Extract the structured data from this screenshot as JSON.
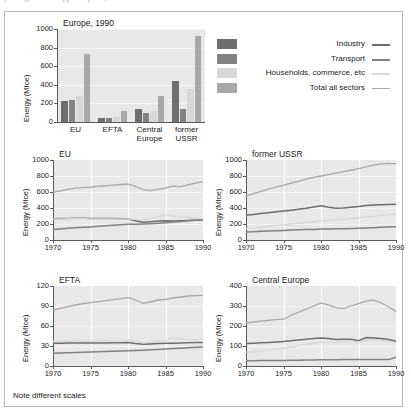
{
  "caption_above": "(not legible — cropped caption)",
  "note": "Note different scales",
  "series_names": {
    "industry": "Industry",
    "transport": "Transport",
    "households": "Households, commerce, etc",
    "total": "Total all sectors"
  },
  "colors": {
    "industry": "#6e6e6e",
    "transport": "#828282",
    "households": "#d8d8d8",
    "total": "#a8a8a8",
    "plot_bg": "#e8e8e8",
    "axis": "#5a5a5a",
    "frame": "#b9b9b9"
  },
  "legend": {
    "rows": [
      {
        "label": "Industry",
        "color": "#6e6e6e"
      },
      {
        "label": "Transport",
        "color": "#828282"
      },
      {
        "label": "Households, commerce, etc",
        "color": "#d8d8d8"
      },
      {
        "label": "Total all sectors",
        "color": "#a8a8a8"
      }
    ]
  },
  "chart_data": [
    {
      "id": "europe-1990-bars",
      "type": "bar",
      "title": "Europe, 1990",
      "xlabel": "",
      "ylabel": "Energy (Mtoe)",
      "ylim": [
        0,
        1000
      ],
      "yticks": [
        0,
        200,
        400,
        600,
        800,
        1000
      ],
      "grid": true,
      "legend_position": "right",
      "categories": [
        "EU",
        "EFTA",
        "Central Europe",
        "former USSR"
      ],
      "series": [
        {
          "name": "Industry",
          "values": [
            225,
            40,
            138,
            440
          ]
        },
        {
          "name": "Transport",
          "values": [
            238,
            38,
            95,
            142
          ]
        },
        {
          "name": "Households, commerce, etc",
          "values": [
            282,
            50,
            118,
            350
          ]
        },
        {
          "name": "Total all sectors",
          "values": [
            730,
            118,
            278,
            930
          ]
        }
      ]
    },
    {
      "id": "eu-lines",
      "type": "line",
      "title": "EU",
      "xlabel": "",
      "ylabel": "Energy (Mtoe)",
      "xlim": [
        1970,
        1990
      ],
      "ylim": [
        0,
        1000
      ],
      "yticks": [
        0,
        200,
        400,
        600,
        800,
        1000
      ],
      "xticks": [
        1970,
        1975,
        1980,
        1985,
        1990
      ],
      "grid": true,
      "x": [
        1970,
        1971,
        1972,
        1973,
        1974,
        1975,
        1976,
        1977,
        1978,
        1979,
        1980,
        1981,
        1982,
        1983,
        1984,
        1985,
        1986,
        1987,
        1988,
        1989,
        1990
      ],
      "series": [
        {
          "name": "Industry",
          "values": [
            265,
            268,
            270,
            272,
            272,
            270,
            270,
            268,
            268,
            266,
            262,
            240,
            222,
            228,
            236,
            240,
            238,
            240,
            244,
            248,
            250
          ]
        },
        {
          "name": "Transport",
          "values": [
            130,
            138,
            146,
            154,
            158,
            164,
            172,
            178,
            184,
            190,
            196,
            198,
            200,
            204,
            210,
            216,
            224,
            232,
            240,
            246,
            252
          ]
        },
        {
          "name": "Households, commerce, etc",
          "values": [
            262,
            264,
            266,
            268,
            266,
            264,
            264,
            264,
            264,
            262,
            260,
            258,
            250,
            268,
            290,
            320,
            300,
            290,
            282,
            272,
            268
          ]
        },
        {
          "name": "Total all sectors",
          "values": [
            600,
            615,
            632,
            648,
            655,
            660,
            670,
            678,
            686,
            694,
            700,
            672,
            630,
            616,
            632,
            650,
            672,
            668,
            690,
            712,
            730
          ]
        }
      ]
    },
    {
      "id": "former-ussr-lines",
      "type": "line",
      "title": "former USSR",
      "xlabel": "",
      "ylabel": "Energy (Mtoe)",
      "xlim": [
        1970,
        1990
      ],
      "ylim": [
        0,
        1000
      ],
      "yticks": [
        0,
        200,
        400,
        600,
        800,
        1000
      ],
      "xticks": [
        1970,
        1975,
        1980,
        1985,
        1990
      ],
      "grid": true,
      "x": [
        1970,
        1971,
        1972,
        1973,
        1974,
        1975,
        1976,
        1977,
        1978,
        1979,
        1980,
        1981,
        1982,
        1983,
        1984,
        1985,
        1986,
        1987,
        1988,
        1989,
        1990
      ],
      "series": [
        {
          "name": "Industry",
          "values": [
            308,
            318,
            330,
            342,
            352,
            362,
            372,
            384,
            396,
            412,
            428,
            410,
            396,
            400,
            408,
            418,
            432,
            436,
            440,
            444,
            448
          ]
        },
        {
          "name": "Transport",
          "values": [
            100,
            104,
            108,
            112,
            116,
            120,
            124,
            128,
            130,
            132,
            136,
            138,
            140,
            142,
            144,
            146,
            150,
            154,
            158,
            162,
            165
          ]
        },
        {
          "name": "Households, commerce, etc",
          "values": [
            142,
            152,
            162,
            172,
            182,
            190,
            200,
            210,
            218,
            228,
            238,
            246,
            254,
            262,
            270,
            278,
            288,
            298,
            308,
            318,
            330
          ]
        },
        {
          "name": "Total all sectors",
          "values": [
            548,
            580,
            608,
            636,
            660,
            684,
            710,
            734,
            760,
            782,
            800,
            818,
            836,
            854,
            872,
            892,
            914,
            936,
            952,
            958,
            952
          ]
        }
      ]
    },
    {
      "id": "efta-lines",
      "type": "line",
      "title": "EFTA",
      "xlabel": "",
      "ylabel": "Energy (Mtoe)",
      "xlim": [
        1970,
        1990
      ],
      "ylim": [
        0,
        120
      ],
      "yticks": [
        0,
        30,
        60,
        90,
        120
      ],
      "xticks": [
        1970,
        1975,
        1980,
        1985,
        1990
      ],
      "grid": true,
      "x": [
        1970,
        1971,
        1972,
        1973,
        1974,
        1975,
        1976,
        1977,
        1978,
        1979,
        1980,
        1981,
        1982,
        1983,
        1984,
        1985,
        1986,
        1987,
        1988,
        1989,
        1990
      ],
      "series": [
        {
          "name": "Industry",
          "values": [
            34.0,
            34.2,
            34.4,
            34.6,
            34.6,
            34.4,
            34.6,
            34.6,
            34.8,
            35.0,
            35.2,
            33.6,
            32.6,
            33.0,
            33.6,
            34.0,
            34.2,
            34.6,
            35.0,
            35.2,
            35.4
          ]
        },
        {
          "name": "Transport",
          "values": [
            19.0,
            19.4,
            19.8,
            20.2,
            20.6,
            21.0,
            21.4,
            21.8,
            22.2,
            22.6,
            23.0,
            23.4,
            23.8,
            24.2,
            24.8,
            25.4,
            26.2,
            26.8,
            27.4,
            28.0,
            28.6
          ]
        },
        {
          "name": "Households, commerce, etc",
          "values": [
            37.0,
            37.2,
            37.4,
            37.6,
            37.6,
            37.4,
            37.6,
            37.8,
            38.0,
            38.2,
            38.6,
            37.6,
            34.6,
            36.0,
            37.8,
            38.6,
            42.4,
            40.6,
            39.8,
            39.6,
            39.8
          ]
        },
        {
          "name": "Total all sectors",
          "values": [
            84.0,
            86.5,
            89.0,
            91.5,
            93.5,
            95.0,
            96.5,
            98.0,
            99.5,
            101.0,
            102.5,
            99.0,
            94.0,
            96.0,
            99.0,
            100.0,
            102.0,
            103.5,
            105.0,
            105.5,
            106.0
          ]
        }
      ]
    },
    {
      "id": "central-europe-lines",
      "type": "line",
      "title": "Central Europe",
      "xlabel": "",
      "ylabel": "Energy (Mtoe)",
      "xlim": [
        1970,
        1990
      ],
      "ylim": [
        0,
        400
      ],
      "yticks": [
        0,
        100,
        200,
        300,
        400
      ],
      "xticks": [
        1970,
        1975,
        1980,
        1985,
        1990
      ],
      "grid": true,
      "x": [
        1970,
        1971,
        1972,
        1973,
        1974,
        1975,
        1976,
        1977,
        1978,
        1979,
        1980,
        1981,
        1982,
        1983,
        1984,
        1985,
        1986,
        1987,
        1988,
        1989,
        1990
      ],
      "series": [
        {
          "name": "Industry",
          "values": [
            112,
            114,
            116,
            118,
            120,
            122,
            126,
            130,
            134,
            138,
            140,
            138,
            132,
            134,
            134,
            126,
            142,
            140,
            138,
            132,
            124
          ]
        },
        {
          "name": "Transport",
          "values": [
            26,
            26,
            27,
            27,
            28,
            28,
            29,
            29,
            30,
            30,
            31,
            31,
            31,
            32,
            32,
            32,
            33,
            33,
            33,
            32,
            44
          ]
        },
        {
          "name": "Households, commerce, etc",
          "values": [
            68,
            72,
            76,
            80,
            84,
            88,
            96,
            102,
            108,
            114,
            120,
            120,
            118,
            122,
            124,
            120,
            130,
            130,
            128,
            122,
            116
          ]
        },
        {
          "name": "Total all sectors",
          "values": [
            216,
            220,
            224,
            228,
            232,
            234,
            254,
            268,
            284,
            300,
            314,
            306,
            292,
            288,
            300,
            312,
            324,
            330,
            316,
            296,
            272
          ]
        }
      ]
    }
  ]
}
